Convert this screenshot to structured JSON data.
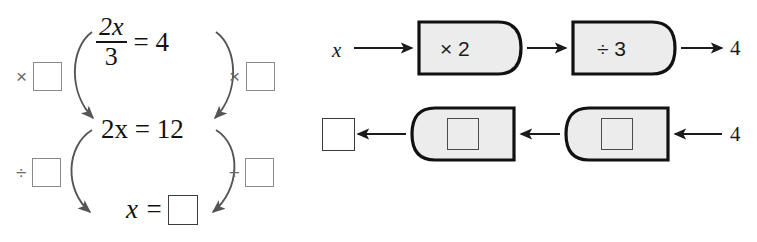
{
  "worksheet": {
    "clipped_header_text": "",
    "left_diagram": {
      "name": "inverse-operations-chain",
      "equations": {
        "top": {
          "numerator": "2x",
          "denominator": "3",
          "equals": "= 4"
        },
        "middle": "2x = 12",
        "bottom_lhs": "x =",
        "bottom_answer": ""
      },
      "operators": {
        "multiply_left": {
          "sign": "×",
          "value": ""
        },
        "multiply_right": {
          "sign": "×",
          "value": ""
        },
        "divide_left": {
          "sign": "÷",
          "value": ""
        },
        "divide_right": {
          "sign": "÷",
          "value": ""
        }
      }
    },
    "right_diagram": {
      "name": "function-machine-chain",
      "forward_row": {
        "input_label": "x",
        "machine_1_label": "× 2",
        "machine_2_label": "÷ 3",
        "output_label": "4"
      },
      "inverse_row": {
        "output_answer": "",
        "machine_1_value": "",
        "machine_2_value": "",
        "input_label": "4"
      }
    },
    "colors": {
      "machine_fill": "#ececec",
      "machine_stroke": "#111111",
      "arrow_stroke": "#1b1b1b",
      "curve_stroke": "#555555",
      "blank_box_stroke": "#8a8a8a",
      "text": "#1b1b1b",
      "background": "#ffffff"
    }
  }
}
